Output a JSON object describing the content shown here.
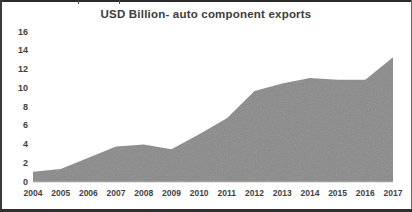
{
  "chart_data": {
    "type": "area",
    "title": "USD Billion- auto component exports",
    "xlabel": "",
    "ylabel": "",
    "categories": [
      "2004",
      "2005",
      "2006",
      "2007",
      "2008",
      "2009",
      "2010",
      "2011",
      "2012",
      "2013",
      "2014",
      "2015",
      "2016",
      "2017"
    ],
    "values": [
      1.1,
      1.4,
      2.6,
      3.8,
      4.0,
      3.5,
      5.1,
      6.8,
      9.7,
      10.5,
      11.1,
      10.9,
      10.9,
      13.3
    ],
    "series": [
      {
        "name": "USD Billion- auto component exports",
        "values": [
          1.1,
          1.4,
          2.6,
          3.8,
          4.0,
          3.5,
          5.1,
          6.8,
          9.7,
          10.5,
          11.1,
          10.9,
          10.9,
          13.3
        ]
      }
    ],
    "ylim": [
      0,
      16
    ],
    "ytick_labels": [
      "0",
      "2",
      "4",
      "6",
      "8",
      "10",
      "12",
      "14",
      "16"
    ],
    "ytick_values": [
      0,
      2,
      4,
      6,
      8,
      10,
      12,
      14,
      16
    ],
    "grid": false,
    "legend": "none",
    "area_fill_color": "#8a8a8a",
    "axis_text_color": "#3f3f3f",
    "title_color": "#3c3c3c",
    "background_color": "#ffffff"
  }
}
